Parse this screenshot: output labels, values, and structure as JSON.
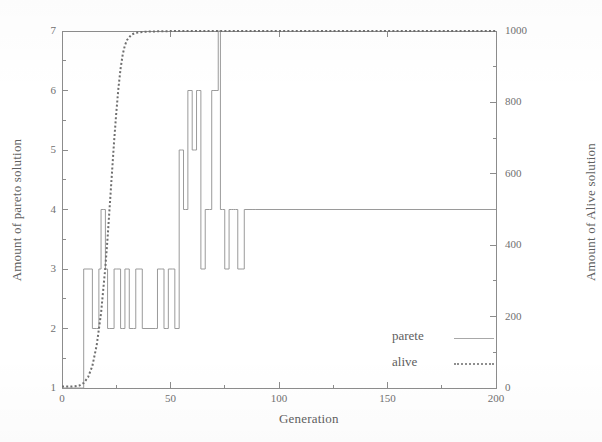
{
  "chart_data": {
    "type": "line",
    "title": "",
    "xlabel": "Generation",
    "ylabel": "Amount of pareto solution",
    "y2label": "Amount of Alive solution",
    "xlim": [
      0,
      200
    ],
    "ylim": [
      1,
      7
    ],
    "y2lim": [
      0,
      1000
    ],
    "grid": false,
    "legend_position": "inside lower-right",
    "xticks": [
      0,
      50,
      100,
      150,
      200
    ],
    "xtick_labels": [
      "0",
      "50",
      "100",
      "150",
      "200"
    ],
    "yticks": [
      1,
      2,
      3,
      4,
      5,
      6,
      7
    ],
    "ytick_labels": [
      "1",
      "2",
      "3",
      "4",
      "5",
      "6",
      "7"
    ],
    "y2ticks": [
      0,
      200,
      400,
      600,
      800,
      1000
    ],
    "y2tick_labels": [
      "0",
      "200",
      "400",
      "600",
      "800",
      "1000"
    ],
    "series": [
      {
        "name": "parete",
        "axis": "left",
        "style": "solid",
        "color": "#9a9a9a",
        "interpolation": "step",
        "x": [
          0,
          9,
          10,
          13,
          14,
          16,
          17,
          18,
          19,
          20,
          21,
          22,
          24,
          25,
          27,
          28,
          29,
          30,
          31,
          33,
          34,
          36,
          37,
          43,
          44,
          46,
          47,
          48,
          49,
          51,
          52,
          53,
          54,
          55,
          56,
          57,
          58,
          59,
          60,
          61,
          62,
          63,
          64,
          65,
          66,
          68,
          69,
          70,
          71,
          72,
          73,
          74,
          75,
          76,
          77,
          78,
          79,
          80,
          81,
          83,
          84,
          88,
          89,
          200
        ],
        "y": [
          1,
          1,
          3,
          3,
          2,
          2,
          3,
          4,
          4,
          3,
          2,
          2,
          3,
          3,
          2,
          2,
          3,
          3,
          2,
          2,
          3,
          3,
          2,
          2,
          3,
          3,
          2,
          2,
          3,
          3,
          2,
          2,
          5,
          5,
          4,
          4,
          6,
          6,
          5,
          5,
          6,
          6,
          3,
          3,
          4,
          4,
          6,
          6,
          6,
          7,
          4,
          4,
          3,
          3,
          4,
          4,
          4,
          4,
          3,
          3,
          4,
          4,
          4,
          4
        ]
      },
      {
        "name": "alive",
        "axis": "right",
        "style": "dotted",
        "color": "#6f6f6f",
        "interpolation": "smooth",
        "x": [
          0,
          2,
          4,
          6,
          8,
          10,
          12,
          14,
          16,
          18,
          20,
          21,
          22,
          23,
          24,
          25,
          26,
          27,
          28,
          29,
          30,
          32,
          34,
          38,
          44,
          52,
          60,
          80,
          100,
          130,
          160,
          200
        ],
        "y": [
          4,
          4,
          4,
          5,
          7,
          14,
          30,
          62,
          120,
          210,
          340,
          420,
          510,
          600,
          690,
          770,
          840,
          895,
          935,
          960,
          975,
          990,
          995,
          998,
          999,
          1000,
          1000,
          1000,
          1000,
          1000,
          1000,
          1000
        ]
      }
    ]
  },
  "axes": {
    "left_title": "Amount of pareto solution",
    "right_title": "Amount of Alive solution",
    "x_title": "Generation"
  },
  "legend": {
    "entries": [
      {
        "label": "parete",
        "style": "solid"
      },
      {
        "label": "alive",
        "style": "dotted"
      }
    ]
  },
  "colors": {
    "pareto_line": "#9a9a9a",
    "alive_line": "#6f6f6f",
    "axis": "#8c8c8c",
    "text": "#5f5f5f",
    "background": "#ffffff"
  }
}
